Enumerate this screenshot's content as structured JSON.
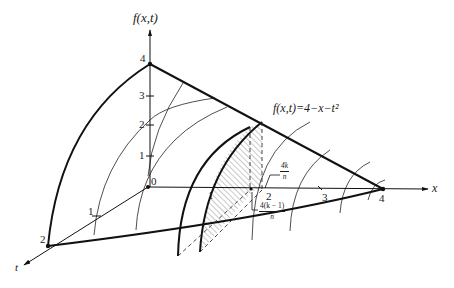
{
  "figure": {
    "type": "3d-surface-plot",
    "function_label": "f(x,t)=4−x−t²",
    "axes": {
      "vertical": {
        "label": "f(x,t)",
        "ticks": [
          "1",
          "2",
          "3",
          "4"
        ]
      },
      "x": {
        "label": "x",
        "ticks": [
          "1",
          "2",
          "3",
          "4"
        ]
      },
      "t": {
        "label": "t",
        "ticks": [
          "1",
          "2"
        ]
      },
      "origin_label": "0"
    },
    "annotations": {
      "upper_bound": {
        "numerator": "4k",
        "denominator": "n"
      },
      "lower_bound": {
        "numerator": "4(k − 1)",
        "denominator": "n"
      }
    },
    "shaded_region": "hatched slab between x = 4(k−1)/n and x = 4k/n"
  }
}
